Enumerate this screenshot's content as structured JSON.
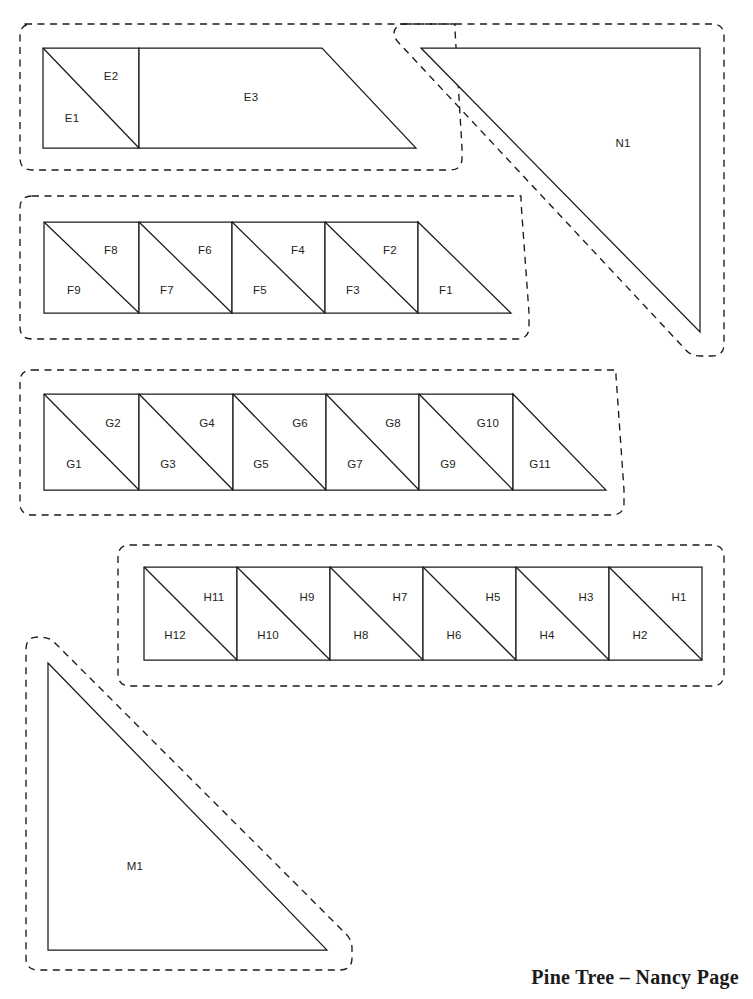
{
  "document": {
    "title": "Pine Tree – Nancy Page",
    "credit": "Pine Tree – Nancy Page",
    "page_width": 753,
    "page_height": 999,
    "background_color": "#ffffff",
    "line_color": "#1a1a1a",
    "label_color": "#231f20"
  },
  "legend": {
    "solid_line_meaning": "finished / sewing line",
    "dashed_line_meaning": "seam allowance cutting line"
  },
  "groups": [
    {
      "id": "group-e",
      "name": "E group",
      "pieces": [
        {
          "label": "E1",
          "shape": "triangle",
          "label_x": 72,
          "label_y": 118
        },
        {
          "label": "E2",
          "shape": "triangle",
          "label_x": 111,
          "label_y": 76
        },
        {
          "label": "E3",
          "shape": "trapezoid",
          "label_x": 251,
          "label_y": 97
        }
      ]
    },
    {
      "id": "group-n",
      "name": "N group",
      "pieces": [
        {
          "label": "N1",
          "shape": "triangle",
          "label_x": 623,
          "label_y": 143
        }
      ]
    },
    {
      "id": "group-f",
      "name": "F group",
      "pieces": [
        {
          "label": "F9",
          "shape": "triangle",
          "label_x": 74,
          "label_y": 290
        },
        {
          "label": "F8",
          "shape": "triangle",
          "label_x": 111,
          "label_y": 250
        },
        {
          "label": "F7",
          "shape": "triangle",
          "label_x": 167,
          "label_y": 290
        },
        {
          "label": "F6",
          "shape": "triangle",
          "label_x": 205,
          "label_y": 250
        },
        {
          "label": "F5",
          "shape": "triangle",
          "label_x": 260,
          "label_y": 290
        },
        {
          "label": "F4",
          "shape": "triangle",
          "label_x": 298,
          "label_y": 250
        },
        {
          "label": "F3",
          "shape": "triangle",
          "label_x": 353,
          "label_y": 290
        },
        {
          "label": "F2",
          "shape": "triangle",
          "label_x": 390,
          "label_y": 250
        },
        {
          "label": "F1",
          "shape": "triangle",
          "label_x": 446,
          "label_y": 290
        }
      ]
    },
    {
      "id": "group-g",
      "name": "G group",
      "pieces": [
        {
          "label": "G1",
          "shape": "triangle",
          "label_x": 74,
          "label_y": 464
        },
        {
          "label": "G2",
          "shape": "triangle",
          "label_x": 113,
          "label_y": 423
        },
        {
          "label": "G3",
          "shape": "triangle",
          "label_x": 168,
          "label_y": 464
        },
        {
          "label": "G4",
          "shape": "triangle",
          "label_x": 207,
          "label_y": 423
        },
        {
          "label": "G5",
          "shape": "triangle",
          "label_x": 261,
          "label_y": 464
        },
        {
          "label": "G6",
          "shape": "triangle",
          "label_x": 300,
          "label_y": 423
        },
        {
          "label": "G7",
          "shape": "triangle",
          "label_x": 355,
          "label_y": 464
        },
        {
          "label": "G8",
          "shape": "triangle",
          "label_x": 393,
          "label_y": 423
        },
        {
          "label": "G9",
          "shape": "triangle",
          "label_x": 448,
          "label_y": 464
        },
        {
          "label": "G10",
          "shape": "triangle",
          "label_x": 488,
          "label_y": 423
        },
        {
          "label": "G11",
          "shape": "triangle",
          "label_x": 540,
          "label_y": 464
        }
      ]
    },
    {
      "id": "group-h",
      "name": "H group",
      "pieces": [
        {
          "label": "H12",
          "shape": "triangle",
          "label_x": 175,
          "label_y": 635
        },
        {
          "label": "H11",
          "shape": "triangle",
          "label_x": 214,
          "label_y": 597
        },
        {
          "label": "H10",
          "shape": "triangle",
          "label_x": 268,
          "label_y": 635
        },
        {
          "label": "H9",
          "shape": "triangle",
          "label_x": 307,
          "label_y": 597
        },
        {
          "label": "H8",
          "shape": "triangle",
          "label_x": 361,
          "label_y": 635
        },
        {
          "label": "H7",
          "shape": "triangle",
          "label_x": 400,
          "label_y": 597
        },
        {
          "label": "H6",
          "shape": "triangle",
          "label_x": 454,
          "label_y": 635
        },
        {
          "label": "H5",
          "shape": "triangle",
          "label_x": 493,
          "label_y": 597
        },
        {
          "label": "H4",
          "shape": "triangle",
          "label_x": 547,
          "label_y": 635
        },
        {
          "label": "H3",
          "shape": "triangle",
          "label_x": 586,
          "label_y": 597
        },
        {
          "label": "H2",
          "shape": "triangle",
          "label_x": 640,
          "label_y": 635
        },
        {
          "label": "H1",
          "shape": "triangle",
          "label_x": 679,
          "label_y": 597
        }
      ]
    },
    {
      "id": "group-m",
      "name": "M group",
      "pieces": [
        {
          "label": "M1",
          "shape": "triangle",
          "label_x": 135,
          "label_y": 866
        }
      ]
    }
  ]
}
